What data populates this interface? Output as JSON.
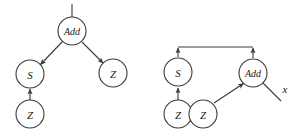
{
  "figure": {
    "title": "",
    "background_color": "#ffffff",
    "stroke_color": "#3a3a3a",
    "text_color": "#1a1a1a",
    "node_radius": 14
  },
  "graphs": [
    {
      "id": "left-graph",
      "name": "term-graph-before",
      "nodes": [
        {
          "id": "l-add",
          "label": "Add",
          "cx": 72,
          "cy": 31
        },
        {
          "id": "l-s",
          "label": "S",
          "cx": 30,
          "cy": 74
        },
        {
          "id": "l-z1",
          "label": "Z",
          "cx": 113,
          "cy": 73
        },
        {
          "id": "l-z2",
          "label": "Z",
          "cx": 30,
          "cy": 114
        }
      ],
      "edges": [
        {
          "from": "root-stub",
          "to": "l-add",
          "kind": "stub"
        },
        {
          "from": "l-add",
          "to": "l-s",
          "kind": "arrow"
        },
        {
          "from": "l-add",
          "to": "l-z1",
          "kind": "arrow"
        },
        {
          "from": "l-z2",
          "to": "l-s",
          "kind": "arrow"
        }
      ],
      "free_labels": []
    },
    {
      "id": "right-graph",
      "name": "term-graph-after",
      "nodes": [
        {
          "id": "r-s",
          "label": "S",
          "cx": 178,
          "cy": 72
        },
        {
          "id": "r-add",
          "label": "Add",
          "cx": 253,
          "cy": 73
        },
        {
          "id": "r-z1",
          "label": "Z",
          "cx": 178,
          "cy": 114
        },
        {
          "id": "r-z2",
          "label": "Z",
          "cx": 203,
          "cy": 114
        }
      ],
      "edges": [
        {
          "from": "bar",
          "to": "r-s",
          "kind": "arrow-up"
        },
        {
          "from": "bar",
          "to": "r-add",
          "kind": "arrow-up"
        },
        {
          "from": "r-z1",
          "to": "r-s",
          "kind": "arrow"
        },
        {
          "from": "r-z2",
          "to": "r-add",
          "kind": "arrow"
        },
        {
          "from": "r-add",
          "to": "x",
          "kind": "plain-line"
        }
      ],
      "bar": {
        "x1": 178,
        "x2": 253,
        "y": 47
      },
      "free_labels": [
        {
          "id": "r-x",
          "label": "x",
          "x": 285,
          "y": 89
        }
      ]
    }
  ]
}
